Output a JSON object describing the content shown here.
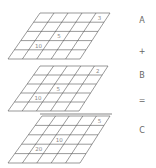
{
  "grids": [
    {
      "id": "A",
      "label": "A",
      "top_y": 13,
      "bottom_y": 59,
      "top_left_x": 40,
      "top_right_x": 110,
      "bottom_left_x": 8,
      "bottom_right_x": 80,
      "rows": 5,
      "cols": 5,
      "cells": [
        {
          "row": 0,
          "col": 4,
          "value": "3"
        },
        {
          "row": 2,
          "col": 2,
          "value": "5"
        },
        {
          "row": 3,
          "col": 1,
          "value": "10"
        }
      ]
    },
    {
      "id": "B",
      "label": "B",
      "top_y": 66,
      "bottom_y": 111,
      "top_left_x": 40,
      "top_right_x": 108,
      "bottom_left_x": 8,
      "bottom_right_x": 79,
      "rows": 5,
      "cols": 5,
      "cells": [
        {
          "row": 0,
          "col": 4,
          "value": "2"
        },
        {
          "row": 2,
          "col": 2,
          "value": "5"
        },
        {
          "row": 3,
          "col": 1,
          "value": "10"
        }
      ]
    },
    {
      "id": "C",
      "label": "C",
      "top_y": 116,
      "bottom_y": 163,
      "top_left_x": 42,
      "top_right_x": 110,
      "bottom_left_x": 8,
      "bottom_right_x": 80,
      "rows": 5,
      "cols": 5,
      "cells": [
        {
          "row": 0,
          "col": 4,
          "value": "5"
        },
        {
          "row": 2,
          "col": 2,
          "value": "10"
        },
        {
          "row": 3,
          "col": 1,
          "value": "20"
        }
      ]
    }
  ],
  "separator_line": {
    "x1": 40,
    "x2": 112,
    "y": 114
  },
  "side_labels": {
    "a": "A",
    "plus": "+",
    "b": "B",
    "equals": "=",
    "c": "C"
  },
  "colors": {
    "grid_line": "#555555",
    "cell_text": "#888888",
    "label_text": "#666666"
  }
}
